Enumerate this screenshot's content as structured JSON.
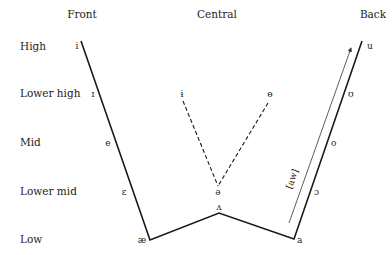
{
  "diagram": {
    "type": "vowel-chart",
    "columns": [
      {
        "id": "front",
        "label": "Front"
      },
      {
        "id": "central",
        "label": "Central"
      },
      {
        "id": "back",
        "label": "Back"
      }
    ],
    "rows": [
      {
        "id": "high",
        "label": "High"
      },
      {
        "id": "lower-high",
        "label": "Lower high"
      },
      {
        "id": "mid",
        "label": "Mid"
      },
      {
        "id": "lower-mid",
        "label": "Lower mid"
      },
      {
        "id": "low",
        "label": "Low"
      }
    ],
    "vowels": {
      "front_high": "i",
      "front_lower_high": "ɪ",
      "front_mid": "e",
      "front_lower_mid": "ɛ",
      "front_low": "æ",
      "central_lower_high_left": "ɨ",
      "central_lower_high_right": "ɵ",
      "central_lower_mid": "ə",
      "central_low": "ʌ",
      "back_high": "u",
      "back_lower_high": "ʊ",
      "back_mid": "o",
      "back_lower_mid": "ɔ",
      "back_low": "a"
    },
    "arrow": {
      "label": "[aw]",
      "from": "a",
      "to": "u"
    },
    "colors": {
      "line": "#1a1a1a",
      "text": "#222222",
      "background": "#ffffff"
    }
  }
}
